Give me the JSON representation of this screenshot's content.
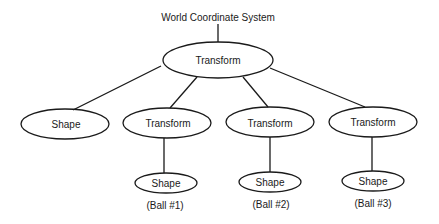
{
  "diagram": {
    "title": "World Coordinate System",
    "nodes": [
      {
        "id": "root",
        "label": "Transform",
        "cx": 218,
        "cy": 60,
        "rx": 55,
        "ry": 18
      },
      {
        "id": "shape-left",
        "label": "Shape",
        "cx": 65,
        "cy": 124,
        "rx": 44,
        "ry": 15
      },
      {
        "id": "transform-1",
        "label": "Transform",
        "cx": 167,
        "cy": 123,
        "rx": 44,
        "ry": 15
      },
      {
        "id": "transform-2",
        "label": "Transform",
        "cx": 270,
        "cy": 122,
        "rx": 44,
        "ry": 15
      },
      {
        "id": "transform-3",
        "label": "Transform",
        "cx": 373,
        "cy": 122,
        "rx": 44,
        "ry": 15
      },
      {
        "id": "ball-1",
        "label": "Shape",
        "cx": 166,
        "cy": 183,
        "rx": 31,
        "ry": 10,
        "caption": "(Ball #1)"
      },
      {
        "id": "ball-2",
        "label": "Shape",
        "cx": 270,
        "cy": 182,
        "rx": 31,
        "ry": 10,
        "caption": "(Ball #2)"
      },
      {
        "id": "ball-3",
        "label": "Shape",
        "cx": 373,
        "cy": 181,
        "rx": 31,
        "ry": 10,
        "caption": "(Ball #3)"
      }
    ],
    "edges": [
      [
        "title",
        "root"
      ],
      [
        "root",
        "shape-left"
      ],
      [
        "root",
        "transform-1"
      ],
      [
        "root",
        "transform-2"
      ],
      [
        "root",
        "transform-3"
      ],
      [
        "transform-1",
        "ball-1"
      ],
      [
        "transform-2",
        "ball-2"
      ],
      [
        "transform-3",
        "ball-3"
      ]
    ],
    "stroke_color": "#1a1a1a"
  }
}
